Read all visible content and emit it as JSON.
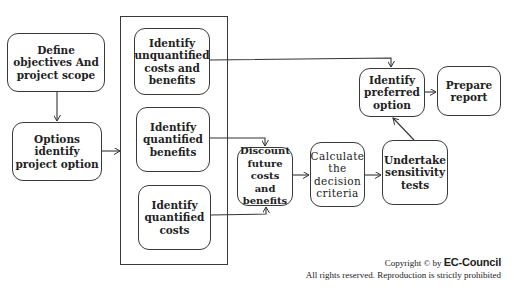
{
  "diagram": {
    "nodes": {
      "define_objectives": "Define objectives And project scope",
      "options_identify": "Options identify project option",
      "identify_unquantified": "Identify unquantified costs and benefits",
      "identify_quantified_benefits": "Identify quantified benefits",
      "identify_quantified_costs": "Identify quantified costs",
      "discount_future": "Discount future costs and benefits",
      "calculate_decision": "Calculate the decision criteria",
      "undertake_sensitivity": "Undertake sensitivity tests",
      "identify_preferred": "Identify preferred option",
      "prepare_report": "Prepare report"
    },
    "edges": [
      {
        "from": "define_objectives",
        "to": "options_identify"
      },
      {
        "from": "options_identify",
        "to": "identification-group"
      },
      {
        "from": "identify_unquantified",
        "to": "identify_preferred"
      },
      {
        "from": "identify_quantified_benefits",
        "to": "discount_future"
      },
      {
        "from": "identify_quantified_costs",
        "to": "discount_future"
      },
      {
        "from": "discount_future",
        "to": "calculate_decision"
      },
      {
        "from": "calculate_decision",
        "to": "undertake_sensitivity"
      },
      {
        "from": "undertake_sensitivity",
        "to": "identify_preferred"
      },
      {
        "from": "identify_preferred",
        "to": "prepare_report"
      }
    ]
  },
  "footer": {
    "copyright_prefix": "Copyright © by ",
    "brand": "EC-Council",
    "rights": "All rights reserved. Reproduction is strictly prohibited"
  }
}
